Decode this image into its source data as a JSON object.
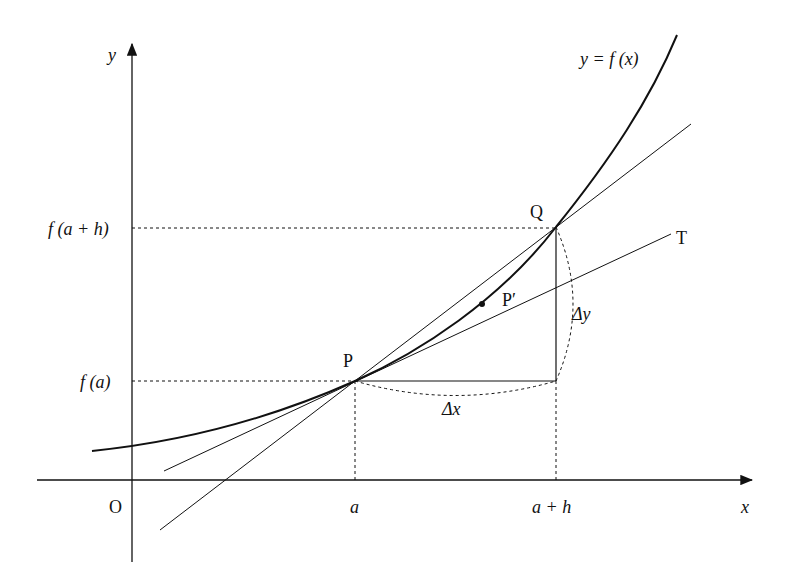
{
  "diagram": {
    "labels": {
      "y_axis": "y",
      "x_axis": "x",
      "origin": "O",
      "curve": "y = f (x)",
      "fah": "f (a + h)",
      "fa": "f (a)",
      "a": "a",
      "aph": "a + h",
      "P": "P",
      "Q": "Q",
      "Pprime": "P′",
      "T": "T",
      "dx": "Δx",
      "dy": "Δy"
    },
    "points": {
      "P": [
        355,
        381
      ],
      "Q": [
        556,
        227
      ],
      "Pprime": [
        482,
        304
      ]
    },
    "colors": {
      "ink": "#111111",
      "background": "#ffffff"
    }
  }
}
